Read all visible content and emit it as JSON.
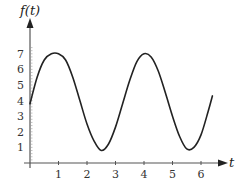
{
  "chart_data": {
    "type": "line",
    "title": "",
    "xlabel": "t",
    "ylabel": "f(t)",
    "xlim": [
      0,
      6.6
    ],
    "ylim": [
      0,
      7.8
    ],
    "x_ticks": [
      "1",
      "2",
      "3",
      "4",
      "5",
      "6"
    ],
    "y_ticks": [
      "1",
      "2",
      "3",
      "4",
      "5",
      "6",
      "7"
    ],
    "grid": false,
    "legend": null,
    "series": [
      {
        "name": "f(t)",
        "x": [
          0,
          0.25,
          0.5,
          0.75,
          1.0,
          1.25,
          1.5,
          1.75,
          2.0,
          2.25,
          2.5,
          2.75,
          3.0,
          3.25,
          3.5,
          3.75,
          4.0,
          4.25,
          4.5,
          4.75,
          5.0,
          5.25,
          5.5,
          5.75,
          6.0,
          6.25,
          6.4
        ],
        "values": [
          3.8,
          5.5,
          6.6,
          7.0,
          7.0,
          6.6,
          5.5,
          4.0,
          2.5,
          1.4,
          0.8,
          1.2,
          2.3,
          3.8,
          5.3,
          6.5,
          7.0,
          6.8,
          5.9,
          4.5,
          3.0,
          1.7,
          0.9,
          1.0,
          1.8,
          3.3,
          4.3
        ]
      }
    ],
    "color": "#222222"
  }
}
